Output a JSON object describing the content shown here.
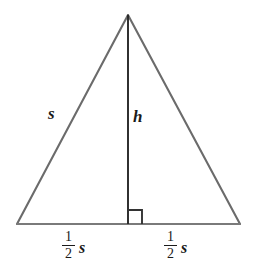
{
  "figure": {
    "background_color": "#ffffff",
    "side_stroke_color": "#6b6b6b",
    "base_stroke_color": "#7a7a7a",
    "altitude_stroke_color": "#262626",
    "right_angle_stroke_color": "#333333",
    "label_color": "#1a1a1a"
  },
  "labels": {
    "left_side": "s",
    "altitude": "h",
    "base_left": {
      "numerator": "1",
      "denominator": "2",
      "variable": "s"
    },
    "base_right": {
      "numerator": "1",
      "denominator": "2",
      "variable": "s"
    }
  },
  "chart_data": {
    "type": "diagram",
    "shape": "isosceles-triangle",
    "vertices": {
      "apex": [
        128,
        15
      ],
      "bottom_left": [
        17,
        224
      ],
      "bottom_right": [
        240,
        224
      ]
    },
    "segments": [
      {
        "name": "left-side",
        "from": [
          17,
          224
        ],
        "to": [
          128,
          15
        ],
        "label": "s",
        "color": "#6b6b6b"
      },
      {
        "name": "right-side",
        "from": [
          128,
          15
        ],
        "to": [
          240,
          224
        ],
        "label": "",
        "color": "#6b6b6b"
      },
      {
        "name": "base",
        "from": [
          17,
          224
        ],
        "to": [
          240,
          224
        ],
        "label": "",
        "color": "#7a7a7a"
      },
      {
        "name": "altitude",
        "from": [
          128,
          15
        ],
        "to": [
          128,
          224
        ],
        "label": "h",
        "color": "#262626"
      }
    ],
    "right_angle_marker": {
      "at": [
        128,
        224
      ],
      "side": "right",
      "size": 14
    },
    "annotations": [
      {
        "text": "s",
        "x": 52,
        "y": 113
      },
      {
        "text": "h",
        "x": 139,
        "y": 118
      },
      {
        "text": "1/2 s",
        "x": 78,
        "y": 245
      },
      {
        "text": "1/2 s",
        "x": 180,
        "y": 245
      }
    ]
  }
}
